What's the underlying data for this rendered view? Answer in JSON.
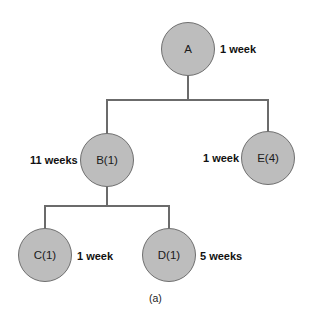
{
  "diagram": {
    "type": "tree",
    "nodes": [
      {
        "id": "A",
        "label": "A",
        "duration": "1 week"
      },
      {
        "id": "B",
        "label": "B(1)",
        "duration": "11 weeks",
        "parent": "A"
      },
      {
        "id": "E",
        "label": "E(4)",
        "duration": "1 week",
        "parent": "A"
      },
      {
        "id": "C",
        "label": "C(1)",
        "duration": "1 week",
        "parent": "B"
      },
      {
        "id": "D",
        "label": "D(1)",
        "duration": "5 weeks",
        "parent": "B"
      }
    ],
    "edges": [
      {
        "from": "A",
        "to": "B"
      },
      {
        "from": "A",
        "to": "E"
      },
      {
        "from": "B",
        "to": "C"
      },
      {
        "from": "B",
        "to": "D"
      }
    ],
    "caption": "(a)",
    "colors": {
      "node_fill": "#bdbdbd",
      "node_border": "#6f6f6f",
      "line": "#6b6b6b"
    }
  }
}
